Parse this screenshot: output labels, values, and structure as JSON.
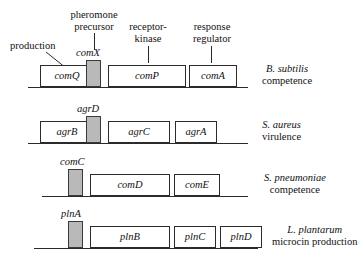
{
  "figure": {
    "type": "gene-operon-diagram",
    "background": "#ffffff",
    "shaded_box_color": "#b9b9b9",
    "line_color": "#2b2b2b"
  },
  "callouts": [
    {
      "id": "production",
      "text": "production",
      "lines": [
        "production"
      ]
    },
    {
      "id": "pheromone-precursor",
      "text": "pheromone precursor",
      "lines": [
        "pheromone",
        "precursor"
      ]
    },
    {
      "id": "receptor-kinase",
      "text": "receptor-kinase",
      "lines": [
        "receptor-",
        "kinase"
      ]
    },
    {
      "id": "response-regulator",
      "text": "response regulator",
      "lines": [
        "response",
        "regulator"
      ]
    }
  ],
  "operons": [
    {
      "id": "b-subtilis",
      "species": "B. subtilis",
      "function": "competence",
      "genes": [
        {
          "name": "comQ",
          "shaded": false,
          "label_above": false
        },
        {
          "name": "comX",
          "shaded": true,
          "label_above": true
        },
        {
          "name": "comP",
          "shaded": false,
          "label_above": false
        },
        {
          "name": "comA",
          "shaded": false,
          "label_above": false
        }
      ]
    },
    {
      "id": "s-aureus",
      "species": "S. aureus",
      "function": "virulence",
      "genes": [
        {
          "name": "agrB",
          "shaded": false,
          "label_above": false
        },
        {
          "name": "agrD",
          "shaded": true,
          "label_above": true
        },
        {
          "name": "agrC",
          "shaded": false,
          "label_above": false
        },
        {
          "name": "agrA",
          "shaded": false,
          "label_above": false
        }
      ]
    },
    {
      "id": "s-pneumoniae",
      "species": "S. pneumoniae",
      "function": "competence",
      "genes": [
        {
          "name": "comC",
          "shaded": true,
          "label_above": true
        },
        {
          "name": "comD",
          "shaded": false,
          "label_above": false
        },
        {
          "name": "comE",
          "shaded": false,
          "label_above": false
        }
      ]
    },
    {
      "id": "l-plantarum",
      "species": "L. plantarum",
      "function": "microcin production",
      "genes": [
        {
          "name": "plnA",
          "shaded": true,
          "label_above": true
        },
        {
          "name": "plnB",
          "shaded": false,
          "label_above": false
        },
        {
          "name": "plnC",
          "shaded": false,
          "label_above": false
        },
        {
          "name": "plnD",
          "shaded": false,
          "label_above": false
        }
      ]
    }
  ]
}
